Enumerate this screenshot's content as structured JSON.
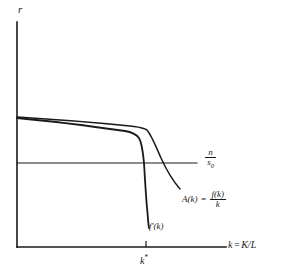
{
  "figure": {
    "title": "",
    "background_color": "#ffffff",
    "line_color": "#1a1a1a",
    "text_color": "#1a1a1a",
    "width": 282,
    "height": 274
  },
  "axes": {
    "y_axis_label": "r",
    "x_axis_label_parts": {
      "variable": "k",
      "equals": "=",
      "expression": "K/L"
    },
    "x_axis_label": "k = K/L",
    "origin": {
      "x": 17,
      "y": 247
    },
    "y_axis_top": {
      "x": 17,
      "y": 22
    },
    "x_axis_right": {
      "x": 226,
      "y": 247
    }
  },
  "ticks": {
    "x": [
      {
        "label": "k*",
        "label_base": "k",
        "label_sup": "*",
        "value_px": 146
      }
    ]
  },
  "curves": [
    {
      "name": "A(k)",
      "label": "A(k) = f(k)/k",
      "label_parts": {
        "lhs": "A(k)",
        "equals": "=",
        "numerator": "f(k)",
        "denominator": "k"
      },
      "description": "average product curve, gently declining then falling steeply past k*",
      "points": [
        [
          17,
          117
        ],
        [
          60,
          120
        ],
        [
          100,
          123
        ],
        [
          130,
          126
        ],
        [
          141,
          127
        ],
        [
          147,
          130
        ],
        [
          152,
          139
        ],
        [
          157,
          150
        ],
        [
          162,
          160
        ],
        [
          168,
          170
        ],
        [
          174,
          180
        ],
        [
          180,
          189
        ]
      ]
    },
    {
      "name": "f'(k)",
      "label": "f'(k)",
      "label_parts": {
        "lhs": "f'(k)"
      },
      "description": "marginal product curve, nearly flat then collapsing vertically just after k*",
      "points": [
        [
          17,
          118
        ],
        [
          60,
          122
        ],
        [
          100,
          127
        ],
        [
          125,
          131
        ],
        [
          134,
          133
        ],
        [
          139,
          137
        ],
        [
          142,
          145
        ],
        [
          144,
          158
        ],
        [
          145,
          172
        ],
        [
          146,
          186
        ],
        [
          147,
          200
        ],
        [
          148,
          214
        ],
        [
          149,
          228
        ]
      ]
    }
  ],
  "reference_lines": [
    {
      "name": "n/s0",
      "orientation": "horizontal",
      "label": "n/s0",
      "label_parts": {
        "numerator": "n",
        "denominator_base": "s",
        "denominator_sub": "0"
      },
      "y_px": 163,
      "x_start_px": 17,
      "x_end_px": 197
    }
  ]
}
